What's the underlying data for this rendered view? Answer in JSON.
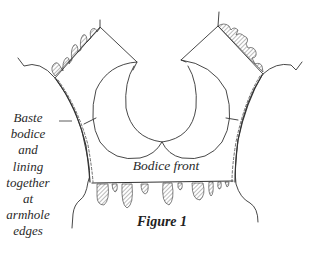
{
  "figure": {
    "caption": "Figure 1",
    "piece_label": "Bodice front",
    "annotation": {
      "lines": [
        "Baste",
        "bodice",
        "and",
        "lining",
        "together",
        "at",
        "armhole",
        "edges"
      ]
    },
    "colors": {
      "line": "#333333",
      "background": "#ffffff"
    }
  }
}
